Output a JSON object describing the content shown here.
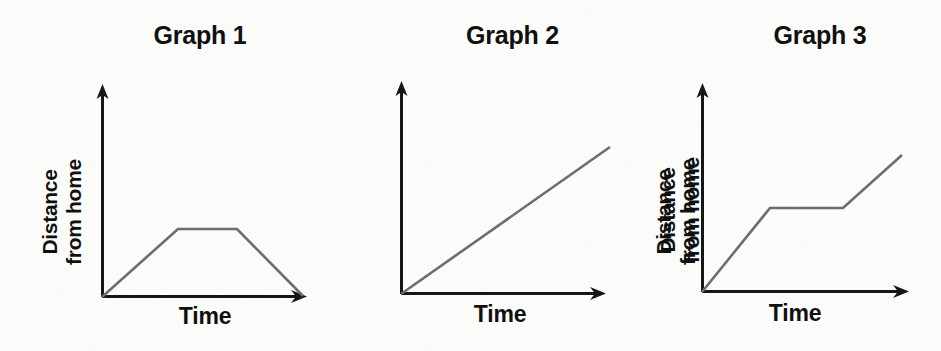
{
  "figure": {
    "background_color": "#fbfbfa",
    "axis_color": "#161616",
    "data_line_color": "#6d6d6d",
    "title_color": "#101010"
  },
  "panels": [
    {
      "title": "Graph 1",
      "xlabel": "Time",
      "ylabel_line1": "Distance",
      "ylabel_line2": "from home"
    },
    {
      "title": "Graph 2",
      "xlabel": "Time",
      "ylabel_line1": "Distance",
      "ylabel_line2": "from home"
    },
    {
      "title": "Graph 3",
      "xlabel": "Time",
      "ylabel_line1": "Distance",
      "ylabel_line2": "from home"
    }
  ],
  "chart_data": [
    {
      "type": "line",
      "title": "Graph 1",
      "xlabel": "Time",
      "ylabel": "Distance from home",
      "x": [
        0,
        0.38,
        0.68,
        1.0
      ],
      "y": [
        0,
        0.65,
        0.65,
        0.0
      ],
      "xlim": [
        0,
        1
      ],
      "ylim": [
        0,
        1
      ],
      "grid": false,
      "legend": "none",
      "annotation": "Travels away from home at a steady rate, stays at a constant distance, then returns home",
      "points_px": "102,297 178,229 237,229 303,296",
      "axis_px": {
        "origin_x": 102,
        "origin_y": 297,
        "y_top": 88,
        "x_right": 305
      }
    },
    {
      "type": "line",
      "title": "Graph 2",
      "xlabel": "Time",
      "ylabel": "Distance from home",
      "x": [
        0,
        1.0
      ],
      "y": [
        0,
        0.72
      ],
      "xlim": [
        0,
        1
      ],
      "ylim": [
        0,
        1
      ],
      "grid": false,
      "legend": "none",
      "annotation": "Moves away from home at a constant steady speed for the whole time",
      "points_px": "401,294 610,147",
      "axis_px": {
        "origin_x": 401,
        "origin_y": 294,
        "y_top": 85,
        "x_right": 604
      }
    },
    {
      "type": "line",
      "title": "Graph 3",
      "xlabel": "Time",
      "ylabel": "Distance from home",
      "x": [
        0,
        0.33,
        0.69,
        0.98
      ],
      "y": [
        0,
        0.41,
        0.41,
        0.67
      ],
      "xlim": [
        0,
        1
      ],
      "ylim": [
        0,
        1
      ],
      "grid": false,
      "legend": "none",
      "annotation": "Moves away from home, stops for a while, then continues moving away",
      "points_px": "702,292 770,208 843,208 902,155",
      "axis_px": {
        "origin_x": 702,
        "origin_y": 292,
        "y_top": 87,
        "x_right": 907
      }
    }
  ]
}
